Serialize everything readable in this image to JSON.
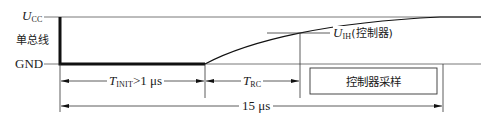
{
  "diagram": {
    "type": "timing-diagram",
    "levels": {
      "high": {
        "symbol": "U",
        "subscript": "CC"
      },
      "bus_label": "单总线",
      "low": "GND"
    },
    "threshold": {
      "symbol": "U",
      "subscript": "IH",
      "suffix": "(控制器)"
    },
    "intervals": [
      {
        "symbol": "T",
        "subscript": "INIT",
        "suffix": ">1 μs"
      },
      {
        "symbol": "T",
        "subscript": "RC",
        "suffix": ""
      }
    ],
    "total": "15 μs",
    "sample_box": "控制器采样",
    "colors": {
      "line": "#1a1a1a",
      "background": "#ffffff",
      "ref_line": "#555555"
    }
  }
}
